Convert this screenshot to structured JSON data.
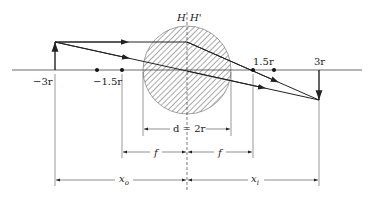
{
  "diagram": {
    "type": "ray-optics-ball-lens",
    "colors": {
      "line": "#222222",
      "hatch": "#555555",
      "background": "#ffffff"
    },
    "principal_planes": {
      "left": "H",
      "right": "H'"
    },
    "axis_labels": {
      "object_position": "−3r",
      "left_focal": "−1.5r",
      "right_focal": "1.5r",
      "image_position": "3r"
    },
    "dimensions": {
      "diameter": "d = 2r",
      "focal_left": "f",
      "focal_right": "f",
      "object_distance": "x",
      "object_distance_sub": "o",
      "image_distance": "x",
      "image_distance_sub": "i"
    },
    "elements": [
      "optical-axis",
      "object-arrow",
      "image-arrow",
      "sphere-lens-hatched",
      "principal-plane-dashed",
      "ray-parallel",
      "ray-through-center",
      "focal-point-dots"
    ]
  }
}
